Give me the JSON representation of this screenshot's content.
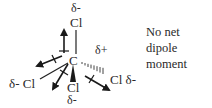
{
  "diagram": {
    "central_atom": "C",
    "central_charge": "δ+",
    "substituents": [
      {
        "position": "top",
        "atom": "Cl",
        "charge": "δ-",
        "bond": "plain"
      },
      {
        "position": "left",
        "atom": "Cl",
        "charge": "δ-",
        "bond": "plain",
        "label": "δ- Cl"
      },
      {
        "position": "bottom",
        "atom": "Cl",
        "charge": "δ-",
        "bond": "wedge"
      },
      {
        "position": "right",
        "atom": "Cl",
        "charge": "δ-",
        "bond": "dashed",
        "label": "Cl δ-"
      }
    ],
    "note_lines": [
      "No net",
      "dipole",
      "moment"
    ]
  }
}
